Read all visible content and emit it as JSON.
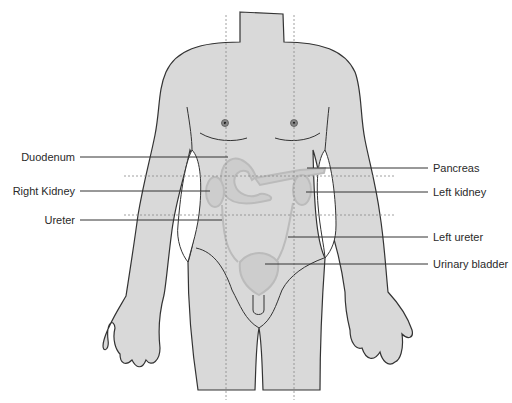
{
  "diagram": {
    "colors": {
      "body_fill": "#d9d9d9",
      "outline": "#333333",
      "organ_fill": "#cdcdcd",
      "organ_stroke": "#bdbdbd",
      "guide_line": "#888888",
      "leader_line": "#333333",
      "background": "#ffffff"
    },
    "labels_left": [
      {
        "text": "Duodenum",
        "y": 157
      },
      {
        "text": "Right Kidney",
        "y": 191
      },
      {
        "text": "Ureter",
        "y": 220
      }
    ],
    "labels_right": [
      {
        "text": "Pancreas",
        "y": 168
      },
      {
        "text": "Left kidney",
        "y": 192
      },
      {
        "text": "Left ureter",
        "y": 237
      },
      {
        "text": "Urinary bladder",
        "y": 264
      }
    ]
  }
}
